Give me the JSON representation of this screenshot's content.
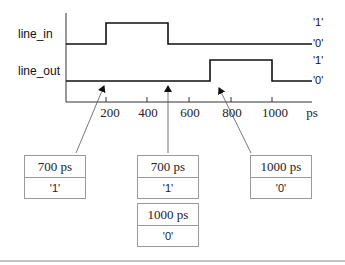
{
  "signals": [
    {
      "name": "line_in",
      "high_label": "'1'",
      "low_label": "'0'"
    },
    {
      "name": "line_out",
      "high_label": "'1'",
      "low_label": "'0'"
    }
  ],
  "axis": {
    "ticks": [
      "200",
      "400",
      "600",
      "800",
      "1000"
    ],
    "unit": "ps"
  },
  "transactions": [
    {
      "time": "700 ps",
      "value": "'1'"
    },
    {
      "time": "700 ps",
      "value": "'1'"
    },
    {
      "time": "1000 ps",
      "value": "'0'"
    },
    {
      "time": "1000 ps",
      "value": "'0'"
    }
  ]
}
